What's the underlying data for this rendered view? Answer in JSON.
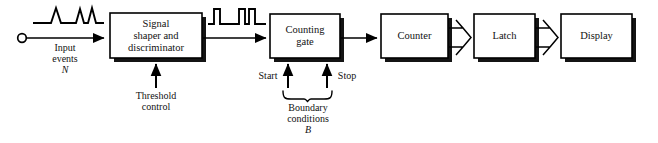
{
  "diagram": {
    "line_color": "#000000",
    "shadow_color": "#1a1a1a",
    "background": "#ffffff",
    "blocks": [
      {
        "id": "shaper",
        "label_lines": [
          "Signal",
          "shaper  and",
          "discriminator"
        ]
      },
      {
        "id": "gate",
        "label_lines": [
          "Counting",
          "gate"
        ]
      },
      {
        "id": "counter",
        "label_lines": [
          "Counter"
        ]
      },
      {
        "id": "latch",
        "label_lines": [
          "Latch"
        ]
      },
      {
        "id": "display",
        "label_lines": [
          "Display"
        ]
      }
    ],
    "annotations": {
      "input": {
        "line1": "Input",
        "line2": "events",
        "symbol": "N"
      },
      "threshold": {
        "line1": "Threshold",
        "line2": "control"
      },
      "start": "Start",
      "stop": "Stop",
      "boundary": {
        "line1": "Boundary",
        "line2": "conditions",
        "symbol": "B"
      }
    },
    "waveforms": {
      "input_pulses": {
        "shape": "triangular-spikes",
        "count": 3,
        "pattern": "1 isolated, 2 adjacent"
      },
      "shaped_pulses": {
        "shape": "square-pulses",
        "count": 3,
        "pattern": "1 isolated, 2 adjacent"
      }
    },
    "connections": [
      {
        "from": "input-terminal",
        "to": "shaper",
        "style": "solid-arrow"
      },
      {
        "from": "shaper",
        "to": "gate",
        "style": "solid-arrow"
      },
      {
        "from": "gate",
        "to": "counter",
        "style": "solid-arrow"
      },
      {
        "from": "counter",
        "to": "latch",
        "style": "bus-arrow"
      },
      {
        "from": "latch",
        "to": "display",
        "style": "bus-arrow"
      },
      {
        "from": "threshold-control",
        "to": "shaper",
        "style": "solid-arrow-up"
      },
      {
        "from": "start",
        "to": "gate",
        "style": "solid-arrow-up"
      },
      {
        "from": "stop",
        "to": "gate",
        "style": "solid-arrow-up"
      }
    ]
  }
}
